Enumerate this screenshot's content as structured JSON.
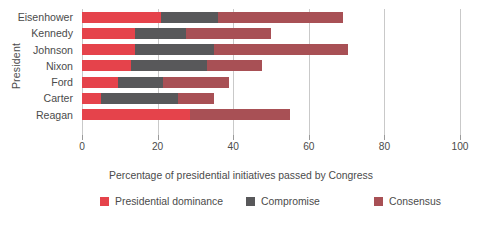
{
  "chart_data": {
    "type": "bar",
    "orientation": "horizontal",
    "stacked": true,
    "title": "",
    "xlabel": "Percentage of presidential initiatives passed by Congress",
    "ylabel": "President",
    "xlim": [
      0,
      100
    ],
    "xticks": [
      0,
      20,
      40,
      60,
      80,
      100
    ],
    "xticklabels": [
      "0",
      "20",
      "40",
      "60",
      "80",
      "100"
    ],
    "grid": "vertical",
    "legend_position": "bottom",
    "categories": [
      "Eisenhower",
      "Kennedy",
      "Johnson",
      "Nixon",
      "Ford",
      "Carter",
      "Reagan"
    ],
    "series": [
      {
        "name": "Presidential dominance",
        "color": "#e5434b",
        "values": [
          21,
          14,
          14,
          13,
          9.5,
          5,
          28.5
        ]
      },
      {
        "name": "Compromise",
        "color": "#58585a",
        "values": [
          15,
          13.5,
          21,
          20,
          12,
          20.5,
          0
        ]
      },
      {
        "name": "Consensus",
        "color": "#a85055",
        "values": [
          33,
          22.5,
          35.5,
          14.5,
          17.5,
          9.5,
          26.5
        ]
      }
    ],
    "totals": [
      69,
      50,
      70.5,
      47.5,
      39,
      35,
      55
    ]
  },
  "legend": {
    "items": [
      {
        "label": "Presidential dominance",
        "color": "#e5434b"
      },
      {
        "label": "Compromise",
        "color": "#58585a"
      },
      {
        "label": "Consensus",
        "color": "#a85055"
      }
    ]
  },
  "colors": {
    "presidential_dominance": "#e5434b",
    "compromise": "#58585a",
    "consensus": "#a85055",
    "grid": "#c9c9c9",
    "text": "#4b4b4b",
    "background": "#ffffff"
  }
}
